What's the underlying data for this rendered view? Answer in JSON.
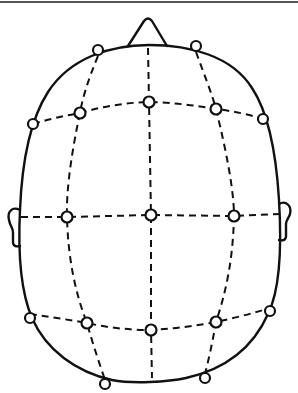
{
  "diagram": {
    "title": "",
    "colors": {
      "stroke": "#111111",
      "background": "#ffffff",
      "top_rule": "#555555"
    },
    "nose": {
      "apex": [
        148,
        19
      ],
      "base_left": [
        128,
        46
      ],
      "base_right": [
        167,
        46
      ]
    },
    "ears": {
      "left": {
        "x": 8,
        "y": 206,
        "w": 13,
        "h": 40
      },
      "right": {
        "x": 278,
        "y": 202,
        "w": 14,
        "h": 38
      }
    },
    "electrodes": [
      {
        "row": "front",
        "pos": "left",
        "cx": 80,
        "cy": 113
      },
      {
        "row": "front",
        "pos": "center",
        "cx": 149,
        "cy": 102
      },
      {
        "row": "front",
        "pos": "right",
        "cx": 216,
        "cy": 109
      },
      {
        "row": "middle",
        "pos": "left",
        "cx": 67,
        "cy": 217
      },
      {
        "row": "middle",
        "pos": "center",
        "cx": 151,
        "cy": 215
      },
      {
        "row": "middle",
        "pos": "right",
        "cx": 234,
        "cy": 216
      },
      {
        "row": "back",
        "pos": "left",
        "cx": 87,
        "cy": 323
      },
      {
        "row": "back",
        "pos": "center",
        "cx": 151,
        "cy": 330
      },
      {
        "row": "back",
        "pos": "right",
        "cx": 216,
        "cy": 322
      }
    ],
    "edge_electrodes": [
      {
        "cx": 98,
        "cy": 50
      },
      {
        "cx": 196,
        "cy": 46
      },
      {
        "cx": 33,
        "cy": 124
      },
      {
        "cx": 263,
        "cy": 119
      },
      {
        "cx": 30,
        "cy": 318
      },
      {
        "cx": 270,
        "cy": 311
      },
      {
        "cx": 105,
        "cy": 384
      },
      {
        "cx": 205,
        "cy": 378
      }
    ]
  }
}
